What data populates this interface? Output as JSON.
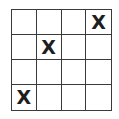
{
  "grid": {
    "rows": 4,
    "cols": 4,
    "cells": [
      [
        "",
        "",
        "",
        "X"
      ],
      [
        "",
        "X",
        "",
        ""
      ],
      [
        "",
        "",
        "",
        ""
      ],
      [
        "X",
        "",
        "",
        ""
      ]
    ]
  }
}
